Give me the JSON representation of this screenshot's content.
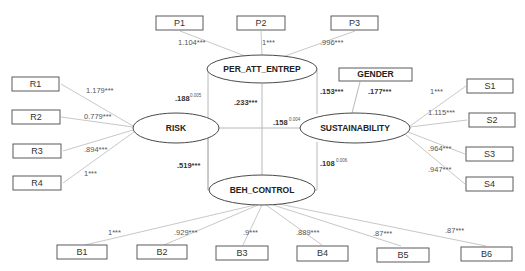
{
  "constructs": {
    "per_att_entrep": "PER_ATT_ENTREP",
    "risk": "RISK",
    "sustainability": "SUSTAINABILITY",
    "beh_control": "BEH_CONTROL",
    "gender": "GENDER"
  },
  "indicators": {
    "P": [
      {
        "label": "P1",
        "loading": "1.104***"
      },
      {
        "label": "P2",
        "loading": "1***"
      },
      {
        "label": "P3",
        "loading": ".996***"
      }
    ],
    "R": [
      {
        "label": "R1",
        "loading": "1.179***"
      },
      {
        "label": "R2",
        "loading": "0.779***"
      },
      {
        "label": "R3",
        "loading": ".894***"
      },
      {
        "label": "R4",
        "loading": "1***"
      }
    ],
    "S": [
      {
        "label": "S1",
        "loading": "1***"
      },
      {
        "label": "S2",
        "loading": "1.115***"
      },
      {
        "label": "S3",
        "loading": ".964***"
      },
      {
        "label": "S4",
        "loading": ".947***"
      }
    ],
    "B": [
      {
        "label": "B1",
        "loading": "1***"
      },
      {
        "label": "B2",
        "loading": ".929***"
      },
      {
        "label": "B3",
        "loading": ".9***"
      },
      {
        "label": "B4",
        "loading": ".889***"
      },
      {
        "label": "B5",
        "loading": ".87***"
      },
      {
        "label": "B6",
        "loading": ".87***"
      }
    ]
  },
  "paths": {
    "risk_to_per_att": {
      "coef": ".188",
      "p": "0.005"
    },
    "beh_to_per_att": {
      "coef": ".233***"
    },
    "risk_to_sust": {
      "coef": ".158",
      "p": "0.004"
    },
    "per_att_to_sust": {
      "coef": ".153***"
    },
    "gender_to_sust": {
      "coef": ".177***"
    },
    "risk_to_beh": {
      "coef": ".519***"
    },
    "beh_to_sust": {
      "coef": ".108",
      "p": "0.006"
    }
  }
}
